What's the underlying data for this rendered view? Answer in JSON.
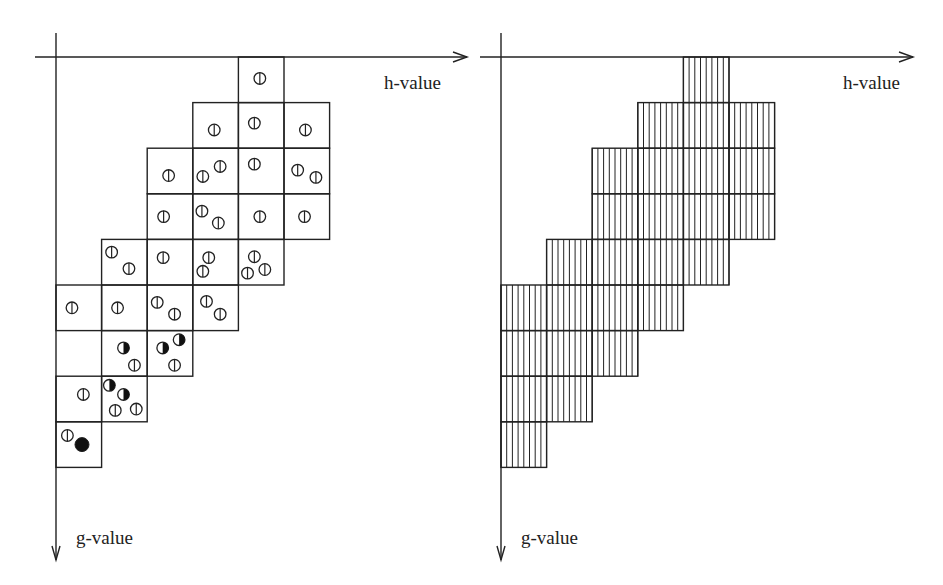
{
  "diagram": {
    "cell_size": 45.6,
    "panels": [
      {
        "id": "left",
        "origin": {
          "x": 56,
          "y": 57
        },
        "h_axis": {
          "label": "h-value",
          "x_start": 35,
          "x_end": 467,
          "label_pos": {
            "x": 384,
            "y": 72
          }
        },
        "g_axis": {
          "label": "g-value",
          "y_start": 33,
          "y_end": 560,
          "label_pos": {
            "x": 76,
            "y": 527
          }
        },
        "style": "nodes",
        "cells": [
          {
            "row": 0,
            "col": 4,
            "nodes": [
              {
                "x": 0.47,
                "y": 0.47,
                "type": "open"
              }
            ]
          },
          {
            "row": 1,
            "col": 3,
            "nodes": [
              {
                "x": 0.47,
                "y": 0.6,
                "type": "open"
              }
            ]
          },
          {
            "row": 1,
            "col": 4,
            "nodes": [
              {
                "x": 0.35,
                "y": 0.45,
                "type": "open"
              }
            ]
          },
          {
            "row": 1,
            "col": 5,
            "nodes": [
              {
                "x": 0.47,
                "y": 0.6,
                "type": "open"
              }
            ]
          },
          {
            "row": 2,
            "col": 2,
            "nodes": [
              {
                "x": 0.47,
                "y": 0.6,
                "type": "open"
              }
            ]
          },
          {
            "row": 2,
            "col": 3,
            "nodes": [
              {
                "x": 0.22,
                "y": 0.62,
                "type": "open"
              },
              {
                "x": 0.6,
                "y": 0.4,
                "type": "open"
              }
            ]
          },
          {
            "row": 2,
            "col": 4,
            "nodes": [
              {
                "x": 0.35,
                "y": 0.35,
                "type": "open"
              }
            ]
          },
          {
            "row": 2,
            "col": 5,
            "nodes": [
              {
                "x": 0.3,
                "y": 0.48,
                "type": "open"
              },
              {
                "x": 0.7,
                "y": 0.64,
                "type": "open"
              }
            ]
          },
          {
            "row": 3,
            "col": 2,
            "nodes": [
              {
                "x": 0.36,
                "y": 0.5,
                "type": "open"
              }
            ]
          },
          {
            "row": 3,
            "col": 3,
            "nodes": [
              {
                "x": 0.2,
                "y": 0.38,
                "type": "open"
              },
              {
                "x": 0.56,
                "y": 0.64,
                "type": "open"
              }
            ]
          },
          {
            "row": 3,
            "col": 4,
            "nodes": [
              {
                "x": 0.47,
                "y": 0.5,
                "type": "open"
              }
            ]
          },
          {
            "row": 3,
            "col": 5,
            "nodes": [
              {
                "x": 0.45,
                "y": 0.5,
                "type": "open"
              }
            ]
          },
          {
            "row": 4,
            "col": 1,
            "nodes": [
              {
                "x": 0.22,
                "y": 0.28,
                "type": "open"
              },
              {
                "x": 0.6,
                "y": 0.64,
                "type": "open"
              }
            ]
          },
          {
            "row": 4,
            "col": 2,
            "nodes": [
              {
                "x": 0.35,
                "y": 0.4,
                "type": "open"
              }
            ]
          },
          {
            "row": 4,
            "col": 3,
            "nodes": [
              {
                "x": 0.35,
                "y": 0.4,
                "type": "open"
              },
              {
                "x": 0.22,
                "y": 0.7,
                "type": "open"
              }
            ]
          },
          {
            "row": 4,
            "col": 4,
            "nodes": [
              {
                "x": 0.35,
                "y": 0.38,
                "type": "open"
              },
              {
                "x": 0.2,
                "y": 0.74,
                "type": "open"
              },
              {
                "x": 0.58,
                "y": 0.66,
                "type": "open"
              }
            ]
          },
          {
            "row": 5,
            "col": 0,
            "nodes": [
              {
                "x": 0.35,
                "y": 0.5,
                "type": "open"
              }
            ]
          },
          {
            "row": 5,
            "col": 1,
            "nodes": [
              {
                "x": 0.35,
                "y": 0.5,
                "type": "open"
              }
            ]
          },
          {
            "row": 5,
            "col": 2,
            "nodes": [
              {
                "x": 0.22,
                "y": 0.38,
                "type": "open"
              },
              {
                "x": 0.6,
                "y": 0.64,
                "type": "open"
              }
            ]
          },
          {
            "row": 5,
            "col": 3,
            "nodes": [
              {
                "x": 0.3,
                "y": 0.36,
                "type": "open"
              },
              {
                "x": 0.6,
                "y": 0.64,
                "type": "open"
              }
            ]
          },
          {
            "row": 6,
            "col": 1,
            "nodes": [
              {
                "x": 0.48,
                "y": 0.38,
                "type": "half"
              },
              {
                "x": 0.72,
                "y": 0.76,
                "type": "open"
              }
            ]
          },
          {
            "row": 6,
            "col": 2,
            "nodes": [
              {
                "x": 0.34,
                "y": 0.38,
                "type": "half"
              },
              {
                "x": 0.7,
                "y": 0.2,
                "type": "half"
              },
              {
                "x": 0.6,
                "y": 0.76,
                "type": "open"
              }
            ]
          },
          {
            "row": 7,
            "col": 0,
            "nodes": [
              {
                "x": 0.6,
                "y": 0.4,
                "type": "open"
              }
            ]
          },
          {
            "row": 7,
            "col": 1,
            "nodes": [
              {
                "x": 0.17,
                "y": 0.2,
                "type": "half"
              },
              {
                "x": 0.48,
                "y": 0.4,
                "type": "half"
              },
              {
                "x": 0.3,
                "y": 0.75,
                "type": "open"
              },
              {
                "x": 0.76,
                "y": 0.72,
                "type": "open"
              }
            ]
          },
          {
            "row": 8,
            "col": 0,
            "nodes": [
              {
                "x": 0.25,
                "y": 0.3,
                "type": "open"
              },
              {
                "x": 0.57,
                "y": 0.5,
                "type": "filled"
              }
            ]
          }
        ]
      },
      {
        "id": "right",
        "origin": {
          "x": 501,
          "y": 57
        },
        "h_axis": {
          "label": "h-value",
          "x_start": 480,
          "x_end": 913,
          "label_pos": {
            "x": 843,
            "y": 72
          }
        },
        "g_axis": {
          "label": "g-value",
          "y_start": 33,
          "y_end": 560,
          "label_pos": {
            "x": 521,
            "y": 527
          }
        },
        "style": "hatched",
        "hatch_spacing": 5.7,
        "rows": [
          {
            "row": 0,
            "col_start": 4,
            "col_end": 4
          },
          {
            "row": 1,
            "col_start": 3,
            "col_end": 5
          },
          {
            "row": 2,
            "col_start": 2,
            "col_end": 5
          },
          {
            "row": 3,
            "col_start": 2,
            "col_end": 5
          },
          {
            "row": 4,
            "col_start": 1,
            "col_end": 4
          },
          {
            "row": 5,
            "col_start": 0,
            "col_end": 3
          },
          {
            "row": 6,
            "col_start": 0,
            "col_end": 2
          },
          {
            "row": 7,
            "col_start": 0,
            "col_end": 1
          },
          {
            "row": 8,
            "col_start": 0,
            "col_end": 0
          }
        ]
      }
    ],
    "colors": {
      "line": "#222222",
      "background": "#ffffff",
      "fill": "#111111"
    }
  }
}
